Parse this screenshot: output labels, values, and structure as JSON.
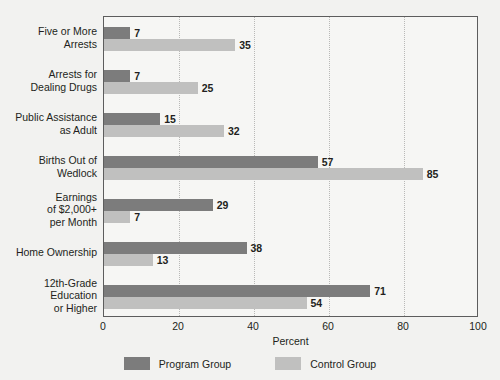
{
  "chart_data": {
    "type": "bar",
    "orientation": "horizontal",
    "title": "",
    "xlabel": "Percent",
    "ylabel": "",
    "xlim": [
      0,
      100
    ],
    "xticks": [
      0,
      20,
      40,
      60,
      80,
      100
    ],
    "xtick_labels": [
      "0",
      "20",
      "40",
      "60",
      "80",
      "100"
    ],
    "grid": "vertical dotted gridlines at x ticks",
    "legend_position": "bottom-center",
    "categories": [
      "Five or More\nArrests",
      "Arrests for\nDealing Drugs",
      "Public Assistance\nas Adult",
      "Births Out of\nWedlock",
      "Earnings\nof $2,000+\nper Month",
      "Home Ownership",
      "12th-Grade\nEducation\nor Higher"
    ],
    "series": [
      {
        "name": "Program Group",
        "color": "#7c7c7c",
        "values": [
          7,
          7,
          15,
          57,
          29,
          38,
          71
        ]
      },
      {
        "name": "Control Group",
        "color": "#c0c0bf",
        "values": [
          35,
          25,
          32,
          85,
          7,
          13,
          54
        ]
      }
    ],
    "value_labels": {
      "program": [
        "7",
        "7",
        "15",
        "57",
        "29",
        "38",
        "71"
      ],
      "control": [
        "35",
        "25",
        "32",
        "85",
        "7",
        "13",
        "54"
      ]
    }
  },
  "legend": {
    "entries": [
      {
        "label": "Program Group",
        "swatch_color": "#7c7c7c"
      },
      {
        "label": "Control Group",
        "swatch_color": "#c0c0bf"
      }
    ]
  },
  "colors": {
    "page_background": "#f2f2f0",
    "plot_background": "#f6f6f4",
    "axis_line": "#5d5d5d",
    "gridline": "#b9b9b7",
    "text": "#231f20",
    "program_group": "#7c7c7c",
    "control_group": "#c0c0bf"
  }
}
